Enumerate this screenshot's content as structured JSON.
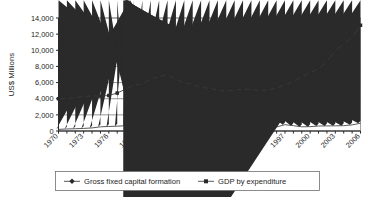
{
  "chart_data": {
    "type": "line",
    "title": "",
    "xlabel": "",
    "ylabel": "US$ Millions",
    "ylim": [
      0,
      14000
    ],
    "ytick_step": 2000,
    "ytick_labels": [
      "0",
      "2,000",
      "4,000",
      "6,000",
      "8,000",
      "10,000",
      "12,000",
      "14,000"
    ],
    "ytick_values": [
      0,
      2000,
      4000,
      6000,
      8000,
      10000,
      12000,
      14000
    ],
    "grid": true,
    "legend_position": "bottom",
    "x": [
      1970,
      1971,
      1972,
      1973,
      1974,
      1975,
      1976,
      1977,
      1978,
      1979,
      1980,
      1981,
      1982,
      1983,
      1984,
      1985,
      1986,
      1987,
      1988,
      1989,
      1990,
      1991,
      1992,
      1993,
      1994,
      1995,
      1996,
      1997,
      1998,
      1999,
      2000,
      2001,
      2002,
      2003,
      2004,
      2005,
      2006
    ],
    "xtick_labels": [
      "1970",
      "1973",
      "1976",
      "1979",
      "1982",
      "1985",
      "1988",
      "1991",
      "1994",
      "1997",
      "2000",
      "2003",
      "2006"
    ],
    "xtick_values": [
      1970,
      1973,
      1976,
      1979,
      1982,
      1985,
      1988,
      1991,
      1994,
      1997,
      2000,
      2003,
      2006
    ],
    "series": [
      {
        "name": "Gross fixed capital formation",
        "marker": "diamond",
        "values": [
          200,
          250,
          280,
          320,
          380,
          520,
          560,
          600,
          650,
          730,
          800,
          820,
          800,
          780,
          700,
          540,
          480,
          420,
          120,
          200,
          650,
          520,
          400,
          380,
          420,
          460,
          500,
          780,
          660,
          520,
          540,
          620,
          630,
          640,
          660,
          760,
          960
        ]
      },
      {
        "name": "GDP by expenditure",
        "marker": "square",
        "values": [
          4000,
          4020,
          4180,
          4250,
          4350,
          4320,
          4400,
          4700,
          5200,
          5700,
          5820,
          6500,
          6700,
          7020,
          6400,
          5980,
          5750,
          5400,
          5300,
          5050,
          4950,
          5050,
          5200,
          5150,
          5000,
          5100,
          5300,
          5700,
          6150,
          6700,
          7250,
          7700,
          8600,
          9950,
          10800,
          11600,
          13100
        ]
      }
    ]
  },
  "legend": {
    "items": [
      {
        "label": "Gross fixed capital formation",
        "marker": "diamond"
      },
      {
        "label": "GDP by expenditure",
        "marker": "square"
      }
    ]
  }
}
